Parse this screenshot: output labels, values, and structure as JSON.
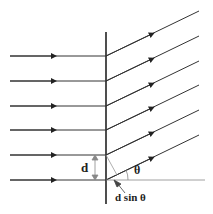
{
  "diagram": {
    "labels": {
      "slit_spacing": "d",
      "angle": "θ",
      "path_difference": "d sin θ"
    },
    "incident_rays": 6,
    "diffracted_rays": 6,
    "colors": {
      "line": "#222222",
      "thin": "#888888"
    }
  }
}
